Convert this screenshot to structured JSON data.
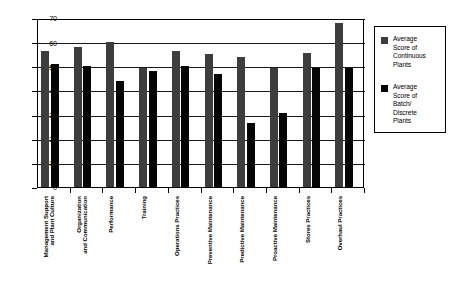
{
  "chart_data": {
    "type": "bar",
    "title": "",
    "xlabel": "",
    "ylabel": "",
    "ylim": [
      0,
      70
    ],
    "ytick_interval": 10,
    "yticks": [
      0,
      10,
      20,
      30,
      40,
      50,
      60,
      70
    ],
    "grid": true,
    "legend_position": "right",
    "categories": [
      "Management Support and Plant Culture",
      "Organization and Communication",
      "Performance",
      "Training",
      "Operations Practices",
      "Preventive Maintenance",
      "Predictive Maintenance",
      "Proactive Maintenance",
      "Stores Practices",
      "Overhaul Practices"
    ],
    "category_lines": [
      [
        "Management Support",
        "and Plant Culture"
      ],
      [
        "Organization",
        "and Communication"
      ],
      [
        "Performance"
      ],
      [
        "Training"
      ],
      [
        "Operations Practices"
      ],
      [
        "Preventive Maintenance"
      ],
      [
        "Predictive Maintenance"
      ],
      [
        "Proactive Maintenance"
      ],
      [
        "Stores Practices"
      ],
      [
        "Overhaul Practices"
      ]
    ],
    "series": [
      {
        "name": "Average Score of Continuous Plants",
        "name_lines": [
          "Average",
          "Score of",
          "Continuous",
          "Plants"
        ],
        "color": "#3d3d3d",
        "values": [
          56.5,
          58,
          60,
          49.5,
          56.5,
          55,
          54,
          49.5,
          55.5,
          68
        ]
      },
      {
        "name": "Average Score of Batch/ Discrete Plants",
        "name_lines": [
          "Average",
          "Score of",
          "Batch/",
          "Discrete",
          "Plants"
        ],
        "color": "#050505",
        "values": [
          51,
          50,
          44,
          48,
          50,
          47,
          26.5,
          30.5,
          49.5,
          49.5
        ]
      }
    ]
  }
}
